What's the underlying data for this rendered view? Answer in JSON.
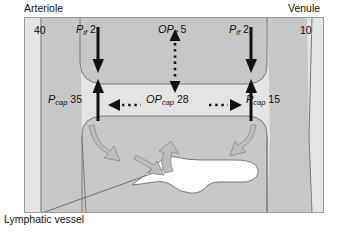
{
  "figure": {
    "title_left": "Arteriole",
    "title_right": "Venule",
    "arteriole_pressure": "40",
    "venule_pressure": "10",
    "lymphatic_label": "Lymphatic vessel",
    "colors": {
      "vessel_fill": "#c9c9c9",
      "interstitium_fill": "#e3e3e3",
      "outline": "#6f6f6f",
      "arrow_black": "#111111",
      "arrow_gray": "#b0b0b0",
      "text": "#111111"
    },
    "pressures": [
      {
        "id": "pif-left",
        "symbol": "P",
        "subscript": "if",
        "value": "2",
        "arrow": "solid-down",
        "side": "left"
      },
      {
        "id": "pcap-left",
        "symbol": "P",
        "subscript": "cap",
        "value": "35",
        "arrow": "solid-up",
        "side": "left"
      },
      {
        "id": "opif-mid",
        "symbol": "OP",
        "subscript": "if",
        "value": "5",
        "arrow": "dotted-updown",
        "side": "middle"
      },
      {
        "id": "opcap-mid",
        "symbol": "OP",
        "subscript": "cap",
        "value": "28",
        "arrow": "dotted-leftright",
        "side": "middle"
      },
      {
        "id": "pif-right",
        "symbol": "P",
        "subscript": "if",
        "value": "2",
        "arrow": "solid-down",
        "side": "right"
      },
      {
        "id": "pcap-right",
        "symbol": "P",
        "subscript": "cap",
        "value": "15",
        "arrow": "solid-up",
        "side": "right"
      }
    ]
  }
}
